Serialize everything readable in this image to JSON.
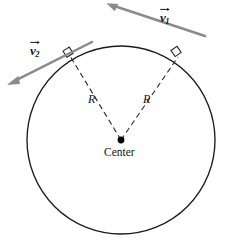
{
  "figure": {
    "kind": "physics-diagram",
    "background_color": "#ffffff"
  },
  "colors": {
    "circle_stroke": "#1b1b1b",
    "radius_dashed": "#2a2a2a",
    "vector_gray": "#8a8a8a",
    "vector_gray_dark": "#6f6f6f",
    "right_angle_marker": "#2a2a2a",
    "center_dot": "#000000",
    "text": "#141414"
  },
  "geometry": {
    "circle": {
      "cx": 121,
      "cy": 140,
      "r": 94
    },
    "tangent_point_1": {
      "x": 178,
      "y": 57
    },
    "tangent_point_2": {
      "x": 70,
      "y": 56
    },
    "center_dot": {
      "x": 121,
      "y": 140,
      "r": 3.4
    },
    "vector_1": {
      "tail_x": 205,
      "tail_y": 36,
      "head_x": 108,
      "head_y": 4
    },
    "vector_2": {
      "tail_x": 92,
      "tail_y": 42,
      "head_x": 8,
      "head_y": 84
    }
  },
  "labels": {
    "vector_1": {
      "symbol": "v",
      "subscript": "1",
      "x": 160,
      "y": 11
    },
    "vector_2": {
      "symbol": "v",
      "subscript": "2",
      "x": 30,
      "y": 44
    },
    "radius_left": {
      "text": "R",
      "x": 88,
      "y": 93
    },
    "radius_right": {
      "text": "R",
      "x": 143,
      "y": 93
    },
    "center": {
      "text": "Center",
      "x": 104,
      "y": 147
    }
  }
}
